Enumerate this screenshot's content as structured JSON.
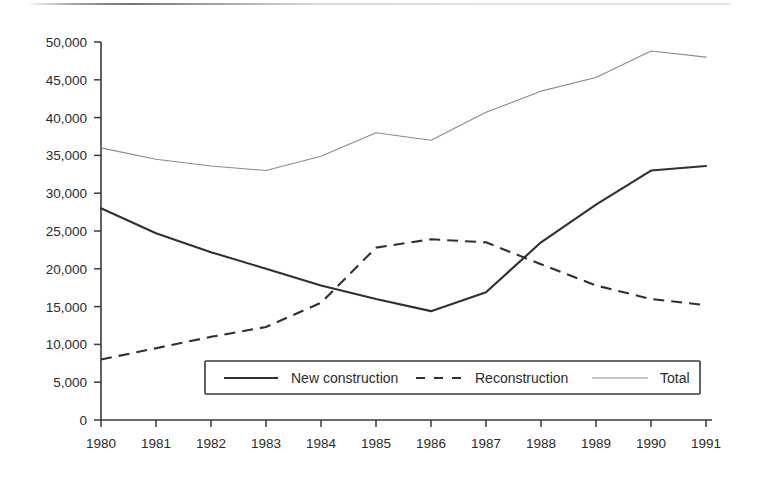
{
  "chart_data": {
    "type": "line",
    "title": "",
    "xlabel": "",
    "ylabel": "",
    "x": [
      1980,
      1981,
      1982,
      1983,
      1984,
      1985,
      1986,
      1987,
      1988,
      1989,
      1990,
      1991
    ],
    "categories": [
      "1980",
      "1981",
      "1982",
      "1983",
      "1984",
      "1985",
      "1986",
      "1987",
      "1988",
      "1989",
      "1990",
      "1991"
    ],
    "xlim": [
      1980,
      1991
    ],
    "ylim": [
      0,
      50000
    ],
    "grid": false,
    "legend_position": "inside-bottom-center",
    "y_ticks": [
      0,
      5000,
      10000,
      15000,
      20000,
      25000,
      30000,
      35000,
      40000,
      45000,
      50000
    ],
    "y_tick_labels": [
      "0",
      "5,000",
      "10,000",
      "15,000",
      "20,000",
      "25,000",
      "30,000",
      "35,000",
      "40,000",
      "45,000",
      "50,000"
    ],
    "x_tick_labels": [
      "1980",
      "1981",
      "1982",
      "1983",
      "1984",
      "1985",
      "1986",
      "1987",
      "1988",
      "1989",
      "1990",
      "1991"
    ],
    "series": [
      {
        "name": "New construction",
        "style": "solid",
        "color": "#303030",
        "values": [
          28000,
          24700,
          22200,
          20000,
          17800,
          16000,
          14400,
          16900,
          23500,
          28500,
          33000,
          33600
        ]
      },
      {
        "name": "Reconstruction",
        "style": "dashed",
        "color": "#303030",
        "values": [
          8000,
          9500,
          11000,
          12300,
          15500,
          22800,
          23900,
          23500,
          20600,
          17800,
          16000,
          15200
        ]
      },
      {
        "name": "Total",
        "style": "thin-solid",
        "color": "#8b8b8b",
        "values": [
          36000,
          34500,
          33600,
          33000,
          34900,
          38000,
          37000,
          40700,
          43500,
          45300,
          48800,
          48000
        ]
      }
    ]
  },
  "legend": {
    "items": [
      {
        "label": "New construction",
        "style": "solid"
      },
      {
        "label": "Reconstruction",
        "style": "dashed"
      },
      {
        "label": "Total",
        "style": "thin-solid"
      }
    ]
  }
}
